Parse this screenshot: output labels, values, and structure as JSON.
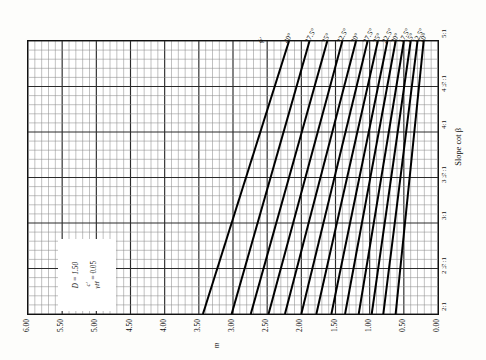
{
  "figure": {
    "annotation": {
      "ratio_numerator": "c′",
      "ratio_denominator": "γH",
      "ratio_value": "= 0.05",
      "depth_factor": "D = 1.50"
    }
  },
  "chart_data": {
    "type": "line",
    "xlabel": "m",
    "ylabel": "Slope cot β",
    "xlim": [
      6.0,
      0.0
    ],
    "ylim": [
      2.0,
      5.0
    ],
    "grid": true,
    "legend_position": "top-inline",
    "x_ticks": [
      "6.00",
      "5.50",
      "5.00",
      "4.50",
      "4.00",
      "3.50",
      "3.00",
      "2.50",
      "2.00",
      "1.50",
      "1.00",
      "0.50",
      "0.00"
    ],
    "x_tick_values": [
      6.0,
      5.5,
      5.0,
      4.5,
      4.0,
      3.5,
      3.0,
      2.5,
      2.0,
      1.5,
      1.0,
      0.5,
      0.0
    ],
    "y_ticks": [
      "2:1",
      "2½:1",
      "3:1",
      "3½:1",
      "4:1",
      "4½:1",
      "5:1"
    ],
    "y_tick_values": [
      2.0,
      2.5,
      3.0,
      3.5,
      4.0,
      4.5,
      5.0
    ],
    "legend_label": "ϕ′",
    "series": [
      {
        "name": "40°",
        "x": [
          3.44,
          2.18
        ],
        "y": [
          2.0,
          5.0
        ]
      },
      {
        "name": "37.5°",
        "x": [
          3.02,
          1.88
        ],
        "y": [
          2.0,
          5.0
        ]
      },
      {
        "name": "35°",
        "x": [
          2.74,
          1.62
        ],
        "y": [
          2.0,
          5.0
        ]
      },
      {
        "name": "32.5°",
        "x": [
          2.48,
          1.4
        ],
        "y": [
          2.0,
          5.0
        ]
      },
      {
        "name": "30°",
        "x": [
          2.24,
          1.2
        ],
        "y": [
          2.0,
          5.0
        ]
      },
      {
        "name": "27.5°",
        "x": [
          2.0,
          1.03
        ],
        "y": [
          2.0,
          5.0
        ]
      },
      {
        "name": "25°",
        "x": [
          1.78,
          0.88
        ],
        "y": [
          2.0,
          5.0
        ]
      },
      {
        "name": "22.5°",
        "x": [
          1.56,
          0.74
        ],
        "y": [
          2.0,
          5.0
        ]
      },
      {
        "name": "20°",
        "x": [
          1.36,
          0.62
        ],
        "y": [
          2.0,
          5.0
        ]
      },
      {
        "name": "17.5°",
        "x": [
          1.16,
          0.5
        ],
        "y": [
          2.0,
          5.0
        ]
      },
      {
        "name": "15°",
        "x": [
          0.97,
          0.4
        ],
        "y": [
          2.0,
          5.0
        ]
      },
      {
        "name": "12.5°",
        "x": [
          0.8,
          0.3
        ],
        "y": [
          2.0,
          5.0
        ]
      },
      {
        "name": "10°",
        "x": [
          0.62,
          0.21
        ],
        "y": [
          2.0,
          5.0
        ]
      }
    ],
    "annotations": [
      "c′/γH = 0.05",
      "D = 1.50"
    ]
  }
}
